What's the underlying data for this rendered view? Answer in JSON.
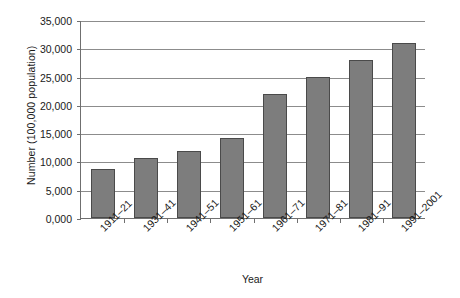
{
  "chart_data": {
    "type": "bar",
    "title": "",
    "subtitle": "",
    "xlabel": "Year",
    "ylabel": "Number (100,000 population)",
    "categories": [
      "1911–21",
      "1931–41",
      "1941–51",
      "1951–61",
      "1961–71",
      "1971–81",
      "1981–91",
      "1991–2001"
    ],
    "values": [
      8700,
      10600,
      11900,
      14100,
      22000,
      25000,
      28000,
      31000
    ],
    "series": [
      {
        "name": "Number",
        "values": [
          8700,
          10600,
          11900,
          14100,
          22000,
          25000,
          28000,
          31000
        ]
      }
    ],
    "ylim": [
      0,
      35000
    ],
    "yticks": [
      0,
      5000,
      10000,
      15000,
      20000,
      25000,
      30000,
      35000
    ],
    "ytick_labels": [
      "0,000",
      "5,000",
      "10,000",
      "15,000",
      "20,000",
      "25,000",
      "30,000",
      "35,000"
    ],
    "grid": "horizontal",
    "legend": "none",
    "bar_color": "#7d7d7d",
    "bar_edge_color": "#4a4a4a",
    "gridline_color": "#8c8c8c",
    "axis_color": "#6f6f6f",
    "background_color": "#ffffff"
  }
}
